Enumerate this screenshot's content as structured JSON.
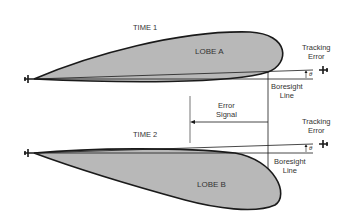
{
  "diagram": {
    "time1": {
      "label": "TIME 1",
      "lobe_label": "LOBE A",
      "tracking_error_label": [
        "Tracking",
        "Error"
      ],
      "boresight_label": [
        "Boresight",
        "Line"
      ],
      "angle_symbol": "θ"
    },
    "time2": {
      "label": "TIME 2",
      "lobe_label": "LOBE B",
      "tracking_error_label": [
        "Tracking",
        "Error"
      ],
      "boresight_label": [
        "Boresight",
        "Line"
      ],
      "angle_symbol": "θ"
    },
    "error_signal_label": [
      "Error",
      "Signal"
    ],
    "colors": {
      "lobe_fill": "#b8b8b8",
      "line": "#1a1a1a"
    }
  }
}
